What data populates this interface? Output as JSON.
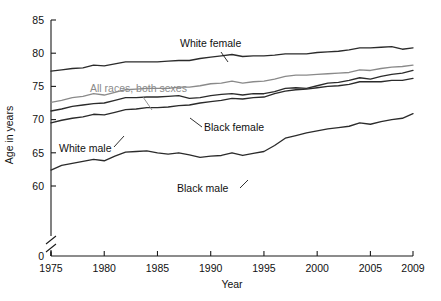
{
  "chart_data": {
    "type": "line",
    "title": "",
    "xlabel": "Year",
    "ylabel": "Age in years",
    "xlim": [
      1975,
      2009
    ],
    "ylim": [
      57.5,
      85
    ],
    "grid": false,
    "legend_position": "inline-annotations",
    "axis_break": true,
    "axis_break_note": "y-axis broken between 0 and ~58",
    "x_ticks": [
      1975,
      1980,
      1985,
      1990,
      1995,
      2000,
      2005,
      2009
    ],
    "x_tick_labels": [
      "1975",
      "1980",
      "1985",
      "1990",
      "1995",
      "2000",
      "2005",
      "2009"
    ],
    "y_ticks": [
      60,
      65,
      70,
      75,
      80,
      85
    ],
    "y_tick_labels": [
      "60",
      "65",
      "70",
      "75",
      "80",
      "85"
    ],
    "y_zero_label": "0",
    "x": [
      1975,
      1976,
      1977,
      1978,
      1979,
      1980,
      1981,
      1982,
      1983,
      1984,
      1985,
      1986,
      1987,
      1988,
      1989,
      1990,
      1991,
      1992,
      1993,
      1994,
      1995,
      1996,
      1997,
      1998,
      1999,
      2000,
      2001,
      2002,
      2003,
      2004,
      2005,
      2006,
      2007,
      2008,
      2009
    ],
    "series": [
      {
        "name": "White female",
        "label": "White female",
        "color": "#2b2b2b",
        "values": [
          77.3,
          77.5,
          77.7,
          77.8,
          78.2,
          78.1,
          78.4,
          78.7,
          78.7,
          78.7,
          78.7,
          78.8,
          78.9,
          78.9,
          79.2,
          79.4,
          79.6,
          79.8,
          79.5,
          79.6,
          79.6,
          79.7,
          79.9,
          79.9,
          79.9,
          80.1,
          80.2,
          80.3,
          80.5,
          80.8,
          80.8,
          80.9,
          81.0,
          80.6,
          80.8
        ]
      },
      {
        "name": "White male",
        "label": "White male",
        "color": "#2b2b2b",
        "values": [
          69.5,
          69.9,
          70.2,
          70.4,
          70.8,
          70.7,
          71.1,
          71.5,
          71.6,
          71.8,
          71.8,
          71.9,
          72.1,
          72.2,
          72.5,
          72.7,
          72.9,
          73.2,
          73.1,
          73.3,
          73.4,
          73.9,
          74.3,
          74.5,
          74.6,
          74.8,
          75.0,
          75.1,
          75.3,
          75.7,
          75.7,
          75.7,
          75.9,
          75.9,
          76.2
        ]
      },
      {
        "name": "All races, both sexes",
        "label": "All races, both sexes",
        "color": "#8a8a8a",
        "values": [
          72.6,
          72.9,
          73.3,
          73.5,
          73.9,
          73.7,
          74.1,
          74.5,
          74.6,
          74.7,
          74.7,
          74.7,
          74.9,
          74.9,
          75.1,
          75.4,
          75.5,
          75.8,
          75.5,
          75.7,
          75.8,
          76.1,
          76.5,
          76.7,
          76.7,
          76.8,
          76.9,
          77.0,
          77.1,
          77.5,
          77.4,
          77.7,
          77.9,
          78.0,
          78.2
        ]
      },
      {
        "name": "Black female",
        "label": "Black female",
        "color": "#2b2b2b",
        "values": [
          71.3,
          71.6,
          72.0,
          72.2,
          72.4,
          72.5,
          72.9,
          73.3,
          73.3,
          73.4,
          73.4,
          73.5,
          73.6,
          73.2,
          73.3,
          73.6,
          73.8,
          73.9,
          73.7,
          73.9,
          73.9,
          74.2,
          74.7,
          74.8,
          74.7,
          75.1,
          75.5,
          75.6,
          75.9,
          76.3,
          76.1,
          76.5,
          76.8,
          77.0,
          77.4
        ]
      },
      {
        "name": "Black male",
        "label": "Black male",
        "color": "#2b2b2b",
        "values": [
          62.4,
          63.1,
          63.4,
          63.7,
          64.0,
          63.8,
          64.5,
          65.1,
          65.2,
          65.3,
          65.0,
          64.8,
          65.0,
          64.7,
          64.3,
          64.5,
          64.6,
          65.0,
          64.6,
          64.9,
          65.2,
          66.1,
          67.2,
          67.6,
          68.0,
          68.3,
          68.6,
          68.8,
          69.0,
          69.5,
          69.3,
          69.7,
          70.0,
          70.2,
          70.9
        ]
      }
    ],
    "annotations": [
      {
        "text": "White female",
        "x_px": 180,
        "y_px": 47,
        "color": "#111111"
      },
      {
        "text": "All races, both sexes",
        "x_px": 90,
        "y_px": 92,
        "color": "#8a8a8a"
      },
      {
        "text": "Black female",
        "x_px": 204,
        "y_px": 131,
        "color": "#111111"
      },
      {
        "text": "White male",
        "x_px": 59,
        "y_px": 152,
        "color": "#111111"
      },
      {
        "text": "Black male",
        "x_px": 177,
        "y_px": 192,
        "color": "#111111"
      }
    ]
  },
  "axes": {
    "y_title": "Age in years",
    "x_title": "Year",
    "y_labels": [
      "85",
      "80",
      "75",
      "70",
      "65",
      "60",
      "0"
    ],
    "x_labels": [
      "1975",
      "1980",
      "1985",
      "1990",
      "1995",
      "2000",
      "2005",
      "2009"
    ]
  },
  "labels": {
    "white_female": "White female",
    "all_races": "All races, both sexes",
    "black_female": "Black female",
    "white_male": "White male",
    "black_male": "Black male"
  },
  "colors": {
    "dark": "#2b2b2b",
    "muted": "#8a8a8a",
    "background": "#ffffff"
  }
}
